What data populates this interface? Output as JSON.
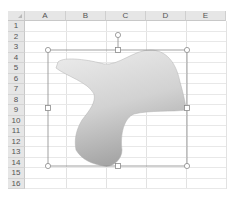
{
  "spreadsheet": {
    "columns": [
      "A",
      "B",
      "C",
      "D",
      "E"
    ],
    "rows": [
      "1",
      "2",
      "3",
      "4",
      "5",
      "6",
      "7",
      "8",
      "9",
      "10",
      "11",
      "12",
      "13",
      "14",
      "15",
      "16"
    ]
  },
  "shape": {
    "type": "freeform",
    "fill_light": "#e9e9e9",
    "fill_dark": "#a9a9a9",
    "selected": true,
    "handles": [
      "top-left",
      "top-center",
      "top-right",
      "middle-left",
      "middle-right",
      "bottom-left",
      "bottom-center",
      "bottom-right",
      "rotation"
    ]
  },
  "colors": {
    "header_bg": "#e6e6e6",
    "grid_line": "#e2e2e2",
    "selection_outline": "#8a8a8a"
  }
}
